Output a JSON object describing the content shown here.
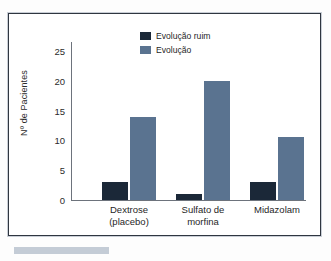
{
  "chart_data": {
    "type": "bar",
    "title": "",
    "xlabel": "",
    "ylabel": "Nº de Pacientes",
    "ylim": [
      0,
      27
    ],
    "yticks": [
      0,
      5,
      10,
      15,
      20,
      25
    ],
    "ytick_labels": [
      "0",
      "5",
      "10",
      "15",
      "20",
      "25"
    ],
    "grid": false,
    "legend_position": "top-center",
    "categories": [
      "Dextrose (placebo)",
      "Sulfato de morfina",
      "Midazolam"
    ],
    "category_lines": [
      [
        "Dextrose",
        "(placebo)"
      ],
      [
        "Sulfato de",
        "morfina"
      ],
      [
        "Midazolam"
      ]
    ],
    "series": [
      {
        "name": "Evolução ruim",
        "color": "#1b2838",
        "values": [
          3,
          1,
          3
        ]
      },
      {
        "name": "Evolução",
        "color": "#5a7390",
        "values": [
          14,
          20,
          10.5
        ]
      }
    ]
  },
  "legend": {
    "items": [
      {
        "label": "Evolução ruim",
        "color": "#1b2838"
      },
      {
        "label": "Evolução",
        "color": "#5a7390"
      }
    ]
  }
}
